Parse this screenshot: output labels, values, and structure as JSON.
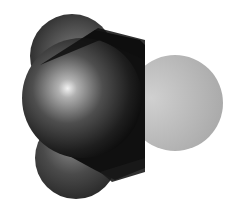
{
  "figure": {
    "type": "space-filling molecular model",
    "atoms": [
      {
        "role": "central",
        "shade": "dark"
      },
      {
        "role": "upper-left",
        "shade": "dark-gray"
      },
      {
        "role": "lower-left",
        "shade": "dark-gray"
      },
      {
        "role": "right",
        "shade": "light-gray"
      }
    ],
    "colors": {
      "background": "#ffffff",
      "central": "#1a1a1a",
      "side": "#3a3a3a",
      "light": "#b8b8b8"
    }
  }
}
